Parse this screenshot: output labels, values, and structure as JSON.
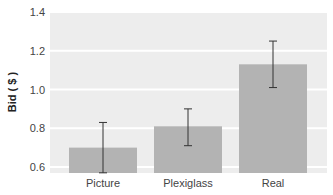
{
  "chart_data": {
    "type": "bar",
    "title": "",
    "xlabel": "",
    "ylabel": "Bid ( $ )",
    "categories": [
      "Picture",
      "Plexiglass",
      "Real"
    ],
    "values": [
      0.7,
      0.81,
      1.13
    ],
    "error_bars": [
      {
        "low": 0.57,
        "high": 0.83
      },
      {
        "low": 0.71,
        "high": 0.9
      },
      {
        "low": 1.01,
        "high": 1.25
      }
    ],
    "ylim": [
      0.6,
      1.4
    ],
    "yticks": [
      "0.6",
      "0.8",
      "1.0",
      "1.2",
      "1.4"
    ],
    "grid": true,
    "colors": {
      "bar": "#b3b3b3",
      "plot_bg": "#ededed",
      "grid": "#ffffff",
      "error": "#333333"
    }
  }
}
